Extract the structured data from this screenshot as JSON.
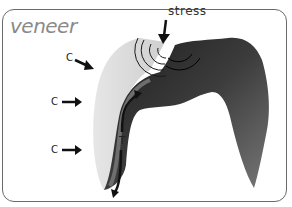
{
  "diagram": {
    "title": "veneer",
    "stress_label": "stress",
    "compression_labels": [
      "C",
      "C",
      "C"
    ],
    "tension_label": "T",
    "colors": {
      "veneer": "#d9d9d9",
      "substructure_dark": "#2a2a2a",
      "substructure_light": "#8c8c8c",
      "arrow": "#111111",
      "frame": "#6a6a6a"
    }
  }
}
